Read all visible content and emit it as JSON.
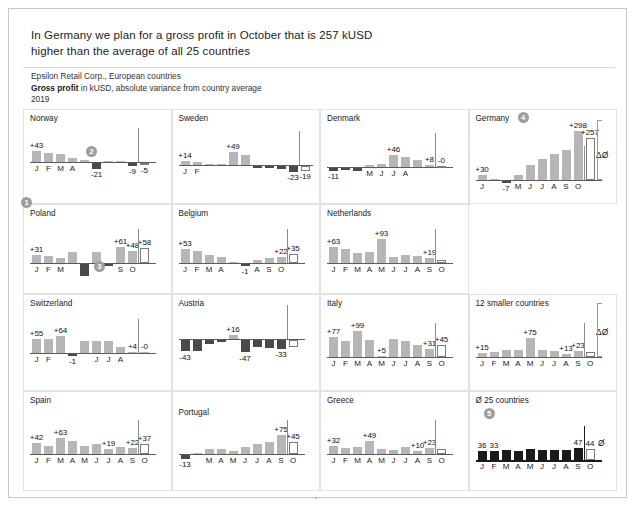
{
  "header": {
    "title_line1": "In Germany we plan for a gross profit in October that is 257 kUSD",
    "title_line2": "higher than the average of all 25 countries",
    "source_line": "Epsilon Retail Corp., European countries",
    "measure_bold": "Gross profit",
    "measure_rest": " in kUSD, absolute variance from country average",
    "year": "2019"
  },
  "annotations": {
    "badge1": "1",
    "badge2": "2",
    "badge3": "3",
    "badge4": "4",
    "badge5": "5",
    "delta_symbol": "ΔØ",
    "avg_symbol": "Ø"
  },
  "chart_data": [
    {
      "type": "bar",
      "title": "Norway",
      "categories": [
        "J",
        "F",
        "M",
        "A",
        "M",
        "J",
        "J",
        "A",
        "S",
        "O"
      ],
      "values": [
        43,
        36,
        31,
        17,
        6,
        -21,
        4,
        5,
        -9,
        -5
      ],
      "labels": {
        "0": "+43",
        "5": "-21",
        "8": "-9",
        "9": "-5"
      },
      "month_labels": {
        "0": "J",
        "1": "F",
        "2": "M",
        "3": "A"
      },
      "open_bars": [
        9
      ],
      "badge": "2",
      "ylabel": "",
      "xlabel": ""
    },
    {
      "type": "bar",
      "title": "Sweden",
      "categories": [
        "J",
        "F",
        "M",
        "A",
        "M",
        "J",
        "J",
        "A",
        "S",
        "O"
      ],
      "values": [
        14,
        13,
        2,
        1,
        49,
        37,
        -1,
        -2,
        -9,
        -23,
        -19
      ],
      "labels": {
        "0": "+14",
        "4": "+49",
        "9": "-23",
        "10": "-19"
      },
      "month_labels": {
        "0": "J",
        "1": "F"
      },
      "open_bars": [
        10
      ],
      "ylabel": "",
      "xlabel": ""
    },
    {
      "type": "bar",
      "title": "Denmark",
      "categories": [
        "J",
        "F",
        "M",
        "A",
        "M",
        "J",
        "J",
        "A",
        "S",
        "O"
      ],
      "values": [
        -11,
        -8,
        -9,
        6,
        12,
        46,
        38,
        27,
        8,
        0
      ],
      "labels": {
        "0": "-11",
        "5": "+46",
        "8": "+8",
        "9": "-0"
      },
      "month_labels": {
        "3": "M",
        "4": "J",
        "5": "J",
        "6": "A"
      },
      "open_bars": [
        9
      ],
      "ylabel": "",
      "xlabel": ""
    },
    {
      "type": "bar",
      "title": "Germany",
      "categories": [
        "J",
        "F",
        "M",
        "A",
        "M",
        "J",
        "J",
        "A",
        "S",
        "O"
      ],
      "values": [
        30,
        5,
        -7,
        28,
        88,
        125,
        160,
        180,
        298,
        257
      ],
      "labels": {
        "0": "+30",
        "2": "-7",
        "8": "+298",
        "9": "+257"
      },
      "month_labels": {
        "0": "J",
        "3": "M",
        "4": "J",
        "5": "J",
        "6": "A",
        "7": "S",
        "8": "O"
      },
      "open_bars": [
        9
      ],
      "badge": "4",
      "delta": "ΔØ",
      "ylabel": "",
      "xlabel": ""
    },
    {
      "type": "bar",
      "title": "Poland",
      "categories": [
        "J",
        "F",
        "M",
        "A",
        "M",
        "J",
        "J",
        "A",
        "S",
        "O"
      ],
      "values": [
        31,
        27,
        18,
        44,
        -45,
        42,
        -4,
        61,
        48,
        58
      ],
      "labels": {
        "0": "+31",
        "7": "+61",
        "8": "+48",
        "9": "+58"
      },
      "month_labels": {
        "0": "J",
        "1": "F",
        "2": "M",
        "7": "S",
        "8": "O"
      },
      "open_bars": [
        9
      ],
      "badge": "3",
      "ylabel": "",
      "xlabel": ""
    },
    {
      "type": "bar",
      "title": "Belgium",
      "categories": [
        "J",
        "F",
        "M",
        "A",
        "M",
        "J",
        "J",
        "A",
        "S",
        "O"
      ],
      "values": [
        53,
        45,
        30,
        24,
        4,
        -1,
        12,
        20,
        22,
        35
      ],
      "labels": {
        "0": "+53",
        "5": "-1",
        "8": "+22",
        "9": "+35"
      },
      "month_labels": {
        "0": "J",
        "1": "F",
        "2": "M",
        "3": "A",
        "6": "A",
        "7": "S",
        "8": "O"
      },
      "open_bars": [
        9
      ],
      "ylabel": "",
      "xlabel": ""
    },
    {
      "type": "bar",
      "title": "Netherlands",
      "categories": [
        "J",
        "F",
        "M",
        "A",
        "M",
        "J",
        "J",
        "A",
        "S",
        "O"
      ],
      "values": [
        63,
        55,
        38,
        41,
        93,
        23,
        30,
        28,
        19,
        12
      ],
      "labels": {
        "0": "+63",
        "4": "+93",
        "8": "+19"
      },
      "month_labels": {
        "0": "J",
        "1": "F",
        "2": "M",
        "3": "A",
        "4": "M",
        "5": "J",
        "6": "J",
        "7": "A",
        "8": "S",
        "9": "O"
      },
      "open_bars": [
        9
      ],
      "ylabel": "",
      "xlabel": ""
    },
    {
      "type": "bar",
      "title": "Switzerland",
      "categories": [
        "J",
        "F",
        "M",
        "A",
        "M",
        "J",
        "J",
        "A",
        "S",
        "O"
      ],
      "values": [
        55,
        52,
        64,
        -1,
        48,
        48,
        45,
        25,
        4,
        0
      ],
      "labels": {
        "0": "+55",
        "2": "+64",
        "3": "-1",
        "8": "+4",
        "9": "-0"
      },
      "month_labels": {
        "0": "J",
        "1": "F",
        "5": "J",
        "6": "J",
        "7": "A"
      },
      "open_bars": [],
      "ylabel": "",
      "xlabel": ""
    },
    {
      "type": "bar",
      "title": "Austria",
      "categories": [
        "J",
        "F",
        "M",
        "A",
        "M",
        "J",
        "J",
        "A",
        "S",
        "O"
      ],
      "values": [
        -43,
        -41,
        -13,
        -8,
        16,
        -47,
        -28,
        -30,
        -33,
        -27
      ],
      "labels": {
        "0": "-43",
        "4": "+16",
        "5": "-47",
        "8": "-33"
      },
      "month_labels": {},
      "open_bars": [
        9
      ],
      "ylabel": "",
      "xlabel": ""
    },
    {
      "type": "bar",
      "title": "Italy",
      "categories": [
        "J",
        "F",
        "M",
        "A",
        "M",
        "J",
        "J",
        "A",
        "S",
        "O"
      ],
      "values": [
        77,
        62,
        99,
        66,
        5,
        70,
        60,
        48,
        31,
        45
      ],
      "labels": {
        "0": "+77",
        "2": "+99",
        "4": "+5",
        "8": "+31",
        "9": "+45"
      },
      "month_labels": {
        "0": "J",
        "1": "F",
        "2": "M",
        "3": "A",
        "4": "M",
        "5": "J",
        "6": "J",
        "7": "A",
        "8": "S",
        "9": "O"
      },
      "open_bars": [
        9
      ],
      "ylabel": "",
      "xlabel": ""
    },
    {
      "type": "bar",
      "title": "12 smaller countries",
      "categories": [
        "J",
        "F",
        "M",
        "A",
        "M",
        "J",
        "J",
        "A",
        "S",
        "O"
      ],
      "values": [
        15,
        19,
        26,
        26,
        75,
        26,
        22,
        13,
        23,
        18
      ],
      "labels": {
        "0": "+15",
        "4": "+75",
        "7": "+13",
        "8": "+23"
      },
      "month_labels": {
        "0": "J",
        "1": "F",
        "2": "M",
        "3": "A",
        "4": "M",
        "5": "J",
        "6": "J",
        "7": "A",
        "8": "S",
        "9": "O"
      },
      "open_bars": [
        9
      ],
      "delta": "ΔØ",
      "ylabel": "",
      "xlabel": ""
    },
    {
      "type": "bar",
      "title": "Spain",
      "categories": [
        "J",
        "F",
        "M",
        "A",
        "M",
        "J",
        "J",
        "A",
        "S",
        "O"
      ],
      "values": [
        42,
        30,
        63,
        50,
        29,
        37,
        19,
        27,
        22,
        37
      ],
      "labels": {
        "0": "+42",
        "2": "+63",
        "6": "+19",
        "8": "+22",
        "9": "+37"
      },
      "month_labels": {
        "0": "J",
        "1": "F",
        "2": "M",
        "3": "A",
        "4": "M",
        "5": "J",
        "6": "J",
        "7": "A",
        "8": "S",
        "9": "O"
      },
      "open_bars": [
        9
      ],
      "ylabel": "",
      "xlabel": ""
    },
    {
      "type": "bar",
      "title": "Portugal",
      "categories": [
        "J",
        "F",
        "M",
        "A",
        "M",
        "J",
        "J",
        "A",
        "S",
        "O"
      ],
      "values": [
        -13,
        2,
        21,
        20,
        13,
        28,
        40,
        45,
        75,
        45
      ],
      "labels": {
        "0": "-13",
        "8": "+75",
        "9": "+45"
      },
      "month_labels": {
        "2": "M",
        "3": "A",
        "4": "M",
        "5": "J",
        "6": "J",
        "7": "A",
        "8": "S",
        "9": "O"
      },
      "open_bars": [
        9
      ],
      "ylabel": "",
      "xlabel": ""
    },
    {
      "type": "bar",
      "title": "Greece",
      "categories": [
        "J",
        "F",
        "M",
        "A",
        "M",
        "J",
        "J",
        "A",
        "S",
        "O"
      ],
      "values": [
        32,
        25,
        27,
        49,
        18,
        17,
        28,
        10,
        23,
        18
      ],
      "labels": {
        "0": "+32",
        "3": "+49",
        "7": "+10",
        "8": "+23"
      },
      "month_labels": {
        "0": "J",
        "1": "F",
        "2": "M",
        "3": "A",
        "4": "M",
        "5": "J",
        "6": "J",
        "7": "A",
        "8": "S",
        "9": "O"
      },
      "open_bars": [
        9
      ],
      "ylabel": "",
      "xlabel": ""
    },
    {
      "type": "bar",
      "title": "Ø 25 countries",
      "categories": [
        "J",
        "F",
        "M",
        "A",
        "M",
        "J",
        "J",
        "A",
        "S",
        "O"
      ],
      "values": [
        36,
        33,
        37,
        36,
        41,
        40,
        38,
        40,
        47,
        44
      ],
      "labels": {
        "0": "36",
        "1": "33",
        "8": "47",
        "9": "44"
      },
      "month_labels": {
        "0": "J",
        "1": "F",
        "2": "M",
        "3": "A",
        "4": "M",
        "5": "J",
        "6": "J",
        "7": "A",
        "8": "S",
        "9": "O"
      },
      "open_bars": [
        9
      ],
      "badge": "5",
      "dark": true,
      "avg": "Ø",
      "ylabel": "",
      "xlabel": ""
    }
  ]
}
